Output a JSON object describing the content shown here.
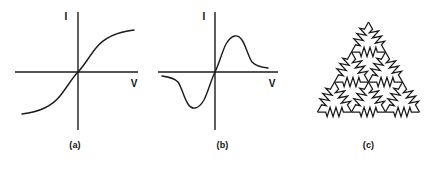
{
  "figure": {
    "background_color": "#ffffff",
    "ink_color": "#1a1a1a",
    "panels": [
      {
        "id": "a",
        "caption": "(a)",
        "axis_y_label": "I",
        "axis_x_label": "V",
        "curve_kind": "sigmoid"
      },
      {
        "id": "b",
        "caption": "(b)",
        "axis_y_label": "I",
        "axis_x_label": "V",
        "curve_kind": "n-shaped-negative-differential-resistance"
      },
      {
        "id": "c",
        "caption": "(c)",
        "network_kind": "triangular-lattice-resistor-network"
      }
    ]
  },
  "chart_data": [
    {
      "type": "line",
      "panel": "a",
      "title": "(a)",
      "xlabel": "V",
      "ylabel": "I",
      "grid": false,
      "legend": null,
      "xlim": [
        -1,
        1
      ],
      "ylim": [
        -1,
        1
      ],
      "description": "Monotonic sigmoid (S-shaped) current-voltage characteristic saturating at both extremes",
      "x": [
        -1.0,
        -0.9,
        -0.8,
        -0.7,
        -0.6,
        -0.5,
        -0.4,
        -0.3,
        -0.2,
        -0.1,
        0.0,
        0.1,
        0.2,
        0.3,
        0.4,
        0.5,
        0.6,
        0.7,
        0.8,
        0.9,
        1.0
      ],
      "y": [
        -0.78,
        -0.76,
        -0.73,
        -0.7,
        -0.66,
        -0.6,
        -0.52,
        -0.42,
        -0.29,
        -0.15,
        0.0,
        0.15,
        0.29,
        0.42,
        0.52,
        0.6,
        0.66,
        0.7,
        0.73,
        0.76,
        0.78
      ]
    },
    {
      "type": "line",
      "panel": "b",
      "title": "(b)",
      "xlabel": "V",
      "ylabel": "I",
      "grid": false,
      "legend": null,
      "xlim": [
        -1,
        1
      ],
      "ylim": [
        -1,
        1
      ],
      "description": "N-shaped characteristic with a current peak followed by a region of negative differential resistance, odd-symmetric about the origin",
      "x": [
        -1.0,
        -0.9,
        -0.8,
        -0.7,
        -0.6,
        -0.5,
        -0.4,
        -0.3,
        -0.2,
        -0.1,
        0.0,
        0.1,
        0.2,
        0.3,
        0.4,
        0.5,
        0.6,
        0.7,
        0.8,
        0.9,
        1.0
      ],
      "y": [
        -0.08,
        -0.09,
        -0.12,
        -0.3,
        -0.62,
        -0.72,
        -0.7,
        -0.6,
        -0.44,
        -0.23,
        0.0,
        0.23,
        0.44,
        0.6,
        0.7,
        0.72,
        0.62,
        0.3,
        0.12,
        0.09,
        0.08
      ]
    },
    {
      "type": "diagram",
      "panel": "c",
      "title": "(c)",
      "description": "Resistor network on a triangular lattice: four rows of nodes (1, 2, 3 and 4 nodes) with a zigzag resistor on every lattice edge, forming a triangular outline",
      "rows_node_counts": [
        1,
        2,
        3,
        4
      ],
      "node_count": 10,
      "resistor_count": 18
    }
  ]
}
